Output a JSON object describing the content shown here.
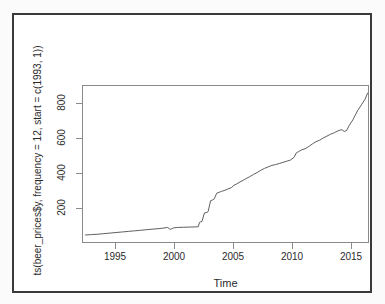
{
  "figure": {
    "background_color": "#ffffff",
    "frame_color": "#3a3a3a",
    "axis_color": "#8a8a8a",
    "line_color": "#4d4d4d"
  },
  "chart_data": {
    "type": "line",
    "title": "",
    "subtitle": "",
    "xlabel": "Time",
    "ylabel": "ts(beer_prices$y, frequency = 12, start = c(1993, 1))",
    "xlim": [
      1992.8,
      2016.2
    ],
    "ylim": [
      60,
      900
    ],
    "xticks": [
      1995,
      2000,
      2005,
      2010,
      2015
    ],
    "xtick_labels": [
      "1995",
      "2000",
      "2005",
      "2010",
      "2015"
    ],
    "yticks": [
      200,
      400,
      600,
      800
    ],
    "ytick_labels": [
      "200",
      "400",
      "600",
      "800"
    ],
    "grid": false,
    "legend": null,
    "legend_position": "none",
    "series": [
      {
        "name": "beer_prices$y",
        "x": [
          1993.0,
          1993.5,
          1994.0,
          1994.5,
          1995.0,
          1995.5,
          1996.0,
          1996.5,
          1997.0,
          1997.5,
          1998.0,
          1998.5,
          1999.0,
          1999.4,
          1999.7,
          1999.9,
          2000.0,
          2000.2,
          2000.5,
          2001.0,
          2001.5,
          2002.0,
          2002.2,
          2002.3,
          2002.4,
          2002.5,
          2002.7,
          2002.9,
          2003.0,
          2003.2,
          2003.4,
          2003.5,
          2003.7,
          2003.9,
          2004.1,
          2004.3,
          2004.6,
          2004.9,
          2005.1,
          2005.3,
          2005.6,
          2005.9,
          2006.1,
          2006.4,
          2006.7,
          2007.0,
          2007.3,
          2007.6,
          2007.9,
          2008.2,
          2008.5,
          2008.8,
          2009.1,
          2009.4,
          2009.7,
          2010.0,
          2010.2,
          2010.4,
          2010.6,
          2010.9,
          2011.2,
          2011.5,
          2011.8,
          2012.1,
          2012.4,
          2012.7,
          2013.0,
          2013.3,
          2013.6,
          2013.9,
          2014.1,
          2014.3,
          2014.5,
          2014.8,
          2015.0,
          2015.2,
          2015.5,
          2015.8,
          2016.0
        ],
        "y": [
          108,
          110,
          112,
          115,
          118,
          121,
          124,
          127,
          130,
          133,
          136,
          139,
          142,
          145,
          148,
          138,
          140,
          146,
          148,
          149,
          150,
          151,
          152,
          175,
          178,
          180,
          225,
          228,
          232,
          290,
          295,
          300,
          330,
          335,
          340,
          344,
          352,
          360,
          372,
          378,
          390,
          400,
          408,
          418,
          430,
          440,
          452,
          462,
          470,
          478,
          482,
          488,
          494,
          500,
          506,
          520,
          545,
          552,
          560,
          566,
          578,
          592,
          604,
          612,
          624,
          634,
          644,
          652,
          662,
          668,
          658,
          664,
          690,
          720,
          745,
          770,
          800,
          830,
          862
        ]
      }
    ]
  }
}
